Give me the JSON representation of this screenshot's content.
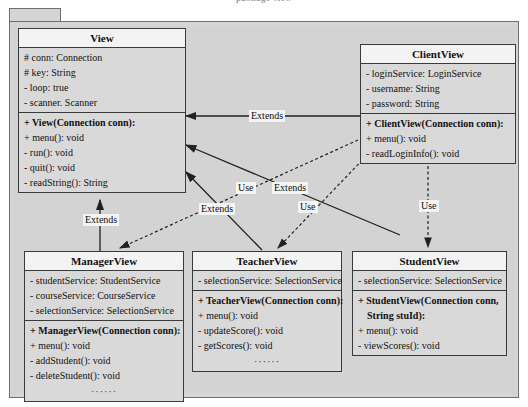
{
  "diagram": {
    "caption": "package view",
    "package_tab_label": "",
    "type": "uml-class-diagram"
  },
  "classes": {
    "view": {
      "name": "View",
      "attributes": [
        "# conn: Connection",
        "# key: String",
        "- loop: true",
        "- scanner. Scanner"
      ],
      "operations": [
        "+ View(Connection conn):",
        "+ menu(): void",
        "- run(): void",
        "- quit(): void",
        "- readString(): String"
      ]
    },
    "client_view": {
      "name": "ClientView",
      "attributes": [
        "- loginService: LoginService",
        "- username: String",
        "- password: String"
      ],
      "operations": [
        "+ ClientView(Connection conn):",
        "+ menu(): void",
        "- readLoginInfo(): void"
      ]
    },
    "manager_view": {
      "name": "ManagerView",
      "attributes": [
        "- studentService: StudentService",
        "- courseService: CourseService",
        "- selectionService: SelectionService"
      ],
      "operations": [
        "+ ManagerView(Connection conn):",
        "+ menu(): void",
        "- addStudent(): void",
        "- deleteStudent(): void"
      ],
      "more_indicator": "······"
    },
    "teacher_view": {
      "name": "TeacherView",
      "attributes": [
        "- selectionService: SelectionService"
      ],
      "operations": [
        "+ TeacherView(Connection conn):",
        "+ menu(): void",
        "- updateScore(): void",
        "- getScores(): void"
      ],
      "more_indicator": "······"
    },
    "student_view": {
      "name": "StudentView",
      "attributes": [
        "- selectionService: SelectionService"
      ],
      "operations": [
        "+ StudentView(Connection conn,",
        "String stuId):",
        "+ menu(): void",
        "- viewScores(): void"
      ]
    }
  },
  "relationships": [
    {
      "label": "Extends",
      "from": "ClientView",
      "to": "View",
      "kind": "generalization"
    },
    {
      "label": "Extends",
      "from": "ManagerView",
      "to": "View",
      "kind": "generalization"
    },
    {
      "label": "Extends",
      "from": "TeacherView",
      "to": "View",
      "kind": "generalization"
    },
    {
      "label": "Extends",
      "from": "StudentView",
      "to": "View",
      "kind": "generalization"
    },
    {
      "label": "Use",
      "from": "ClientView",
      "to": "ManagerView",
      "kind": "dependency"
    },
    {
      "label": "Use",
      "from": "ClientView",
      "to": "TeacherView",
      "kind": "dependency"
    },
    {
      "label": "Use",
      "from": "ClientView",
      "to": "StudentView",
      "kind": "dependency"
    }
  ],
  "colors": {
    "package_fill": "#d3d3d3",
    "class_fill": "#d9d9d9",
    "class_title_fill": "#f3f3f3",
    "border": "#3a3a3a",
    "label_fill": "#f4f4f4"
  }
}
